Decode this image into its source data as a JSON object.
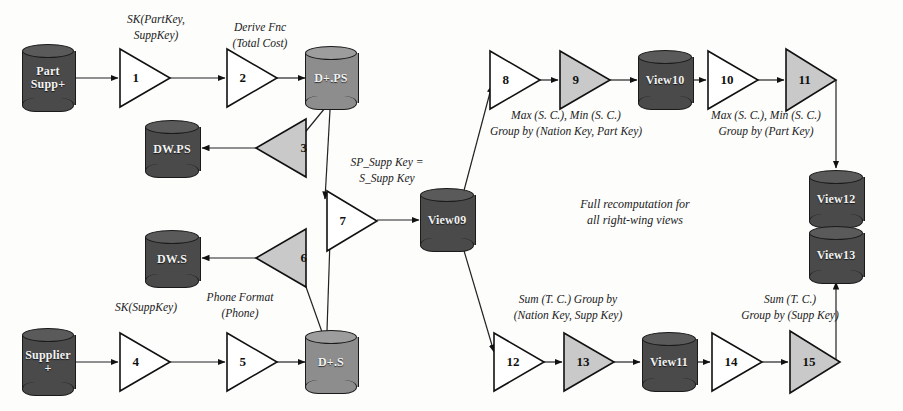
{
  "diagram": {
    "note": {
      "line1": "Full recomputation for",
      "line2": "all right-wing views"
    },
    "colors": {
      "cylinder_dark": "#4a4a4a",
      "cylinder_light": "#8d8d8d",
      "triangle_white": "#ffffff",
      "triangle_gray": "#c9c9c9",
      "stroke": "#1a1a1a"
    },
    "sources": [
      {
        "id": "partsupp",
        "line1": "Part",
        "line2": "Supp+"
      },
      {
        "id": "supplier",
        "line1": "Supplier",
        "line2": "+"
      }
    ],
    "stores": [
      {
        "id": "dpps",
        "label": "D+.PS"
      },
      {
        "id": "dws_ps",
        "label": "DW.PS"
      },
      {
        "id": "dps",
        "label": "D+.S"
      },
      {
        "id": "dws_s",
        "label": "DW.S"
      },
      {
        "id": "view09",
        "label": "View09"
      },
      {
        "id": "view10",
        "label": "View10"
      },
      {
        "id": "view11",
        "label": "View11"
      },
      {
        "id": "view12",
        "label": "View12"
      },
      {
        "id": "view13",
        "label": "View13"
      }
    ],
    "operators": [
      {
        "id": "op1",
        "number": "1",
        "fill": "white",
        "dir": "right"
      },
      {
        "id": "op2",
        "number": "2",
        "fill": "white",
        "dir": "right"
      },
      {
        "id": "op3",
        "number": "3",
        "fill": "gray",
        "dir": "left"
      },
      {
        "id": "op4",
        "number": "4",
        "fill": "white",
        "dir": "right"
      },
      {
        "id": "op5",
        "number": "5",
        "fill": "white",
        "dir": "right"
      },
      {
        "id": "op6",
        "number": "6",
        "fill": "gray",
        "dir": "left"
      },
      {
        "id": "op7",
        "number": "7",
        "fill": "white",
        "dir": "right"
      },
      {
        "id": "op8",
        "number": "8",
        "fill": "white",
        "dir": "right"
      },
      {
        "id": "op9",
        "number": "9",
        "fill": "gray",
        "dir": "right"
      },
      {
        "id": "op10",
        "number": "10",
        "fill": "white",
        "dir": "right"
      },
      {
        "id": "op11",
        "number": "11",
        "fill": "gray",
        "dir": "right"
      },
      {
        "id": "op12",
        "number": "12",
        "fill": "white",
        "dir": "right"
      },
      {
        "id": "op13",
        "number": "13",
        "fill": "gray",
        "dir": "right"
      },
      {
        "id": "op14",
        "number": "14",
        "fill": "white",
        "dir": "right"
      },
      {
        "id": "op15",
        "number": "15",
        "fill": "gray",
        "dir": "right"
      }
    ],
    "annotations": [
      {
        "id": "ann_sk_partkey",
        "line1": "SK(PartKey,",
        "line2": "SuppKey)"
      },
      {
        "id": "ann_derive_fnc",
        "line1": "Derive Fnc",
        "line2": "(Total Cost)"
      },
      {
        "id": "ann_join_key",
        "line1": "SP_Supp Key =",
        "line2": "S_Supp Key"
      },
      {
        "id": "ann_sk_suppkey",
        "line1": "SK(SuppKey)",
        "line2": ""
      },
      {
        "id": "ann_phone",
        "line1": "Phone Format",
        "line2": "(Phone)"
      },
      {
        "id": "ann_maxmin_np",
        "line1": "Max (S. C.), Min (S. C.)",
        "line2": "Group by (Nation Key, Part Key)"
      },
      {
        "id": "ann_maxmin_p",
        "line1": "Max (S. C.), Min (S. C.)",
        "line2": "Group by (Part Key)"
      },
      {
        "id": "ann_sum_ns",
        "line1": "Sum (T. C.) Group by",
        "line2": "(Nation Key, Supp Key)"
      },
      {
        "id": "ann_sum_s",
        "line1": "Sum (T. C.)",
        "line2": "Group by (Supp Key)"
      }
    ]
  }
}
